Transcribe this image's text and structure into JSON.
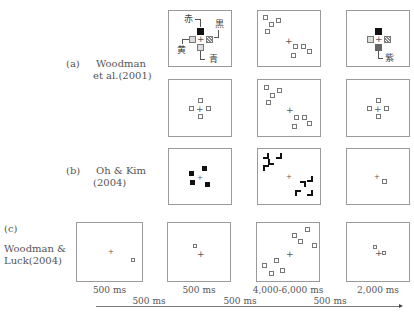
{
  "rows": {
    "a": {
      "tag": "(a)",
      "author_line1": "Woodman",
      "author_line2": "et al.(2001)"
    },
    "b": {
      "tag": "(b)",
      "author_line1": "Oh & Kim",
      "author_line2": "(2004)"
    },
    "c": {
      "tag": "(c)",
      "author_line1": "Woodman &",
      "author_line2": "Luck(2004)"
    }
  },
  "color_labels": {
    "red": "赤",
    "black": "黒",
    "yellow": "黄",
    "blue": "青",
    "purple": "紫"
  },
  "fixation": "+",
  "durations": {
    "frames": [
      "500 ms",
      "500 ms",
      "4,000-6,000 ms",
      "2,000 ms"
    ],
    "intervals": [
      "500 ms",
      "500 ms",
      "500 ms"
    ]
  },
  "timeline": {
    "arrow": "time-arrow"
  }
}
